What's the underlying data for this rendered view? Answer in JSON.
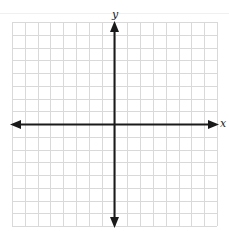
{
  "diagram": {
    "type": "coordinate-plane",
    "axes": {
      "x_label": "x",
      "y_label": "y"
    },
    "grid": {
      "columns": 16,
      "rows": 16,
      "line_color": "#d9d9d9",
      "axis_color": "#1a1a1a"
    }
  }
}
